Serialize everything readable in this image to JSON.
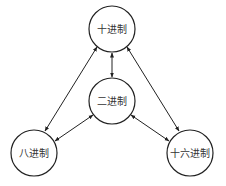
{
  "diagram": {
    "type": "number-base-conversion",
    "stroke_color": "#222222",
    "nodes": [
      {
        "id": "decimal",
        "label": "十进制",
        "cx": 112,
        "cy": 29,
        "r": 23
      },
      {
        "id": "binary",
        "label": "二进制",
        "cx": 112,
        "cy": 101,
        "r": 23
      },
      {
        "id": "octal",
        "label": "八进制",
        "cx": 34,
        "cy": 153,
        "r": 23
      },
      {
        "id": "hexadecimal",
        "label": "十六进制",
        "cx": 190,
        "cy": 153,
        "r": 23
      }
    ],
    "edges": [
      {
        "from": "decimal",
        "to": "binary",
        "bidirectional": true
      },
      {
        "from": "decimal",
        "to": "octal",
        "bidirectional": true
      },
      {
        "from": "decimal",
        "to": "hexadecimal",
        "bidirectional": true
      },
      {
        "from": "binary",
        "to": "octal",
        "bidirectional": true
      },
      {
        "from": "binary",
        "to": "hexadecimal",
        "bidirectional": true
      }
    ]
  }
}
